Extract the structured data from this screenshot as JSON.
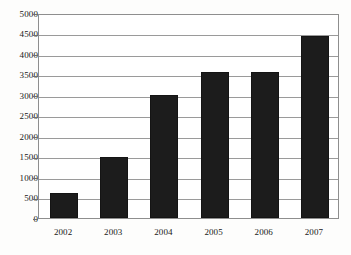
{
  "chart_data": {
    "type": "bar",
    "title": "",
    "subtitle": "",
    "xlabel": "",
    "ylabel": "",
    "categories": [
      "2002",
      "2003",
      "2004",
      "2005",
      "2006",
      "2007"
    ],
    "values": [
      600,
      1500,
      3000,
      3550,
      3550,
      4450
    ],
    "series": [
      {
        "name": "",
        "values": [
          600,
          1500,
          3000,
          3550,
          3550,
          4450
        ]
      }
    ],
    "ylim": [
      0,
      5000
    ],
    "ytick_step": 500,
    "yticks": [
      "0",
      "500",
      "1000",
      "1500",
      "2000",
      "2500",
      "3000",
      "3500",
      "4000",
      "4500",
      "5000"
    ],
    "ytick_values": [
      0,
      500,
      1000,
      1500,
      2000,
      2500,
      3000,
      3500,
      4000,
      4500,
      5000
    ],
    "grid": "horizontal",
    "legend": "none",
    "bar_color": "#1c1c1c",
    "grid_color": "#9a9a9a",
    "frame_color": "#8e8e8e",
    "background_color": "#ffffff"
  }
}
